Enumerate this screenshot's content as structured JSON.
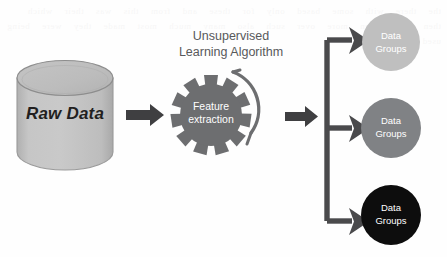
{
  "diagram": {
    "background_color": "#fefefe",
    "source_node": {
      "icon": "database-cylinder-icon",
      "label": "Raw Data",
      "fill_color": "#bfbfbf",
      "stroke_color": "#808285"
    },
    "process_node": {
      "heading_line1": "Unsupervised",
      "heading_line2": "Learning Algorithm",
      "heading_color": "#58595b",
      "icon": "gear-icon",
      "gear_label_line1": "Feature",
      "gear_label_line2": "extraction",
      "gear_fill_color": "#6d6e70",
      "gear_label_color": "#ffffff",
      "rotation_icon": "curved-clockwise-arrow-icon"
    },
    "connectors": {
      "arrow_color": "#3f3f41",
      "arrow_1": "arrow-right-icon",
      "arrow_2": "arrow-right-icon",
      "branch_icon": "branching-arrow-icon",
      "branch_count": 3
    },
    "output_nodes": [
      {
        "label_line1": "Data",
        "label_line2": "Groups",
        "fill_color": "#bfbfbf",
        "label_color": "#ffffff"
      },
      {
        "label_line1": "Data",
        "label_line2": "Groups",
        "fill_color": "#808285",
        "label_color": "#ffffff"
      },
      {
        "label_line1": "Data",
        "label_line2": "Groups",
        "fill_color": "#0d0d0d",
        "label_color": "#ffffff"
      }
    ],
    "ghost_text": "the there with some based only for these and from this was their which then than when more over such also many much most made they were being used into"
  }
}
